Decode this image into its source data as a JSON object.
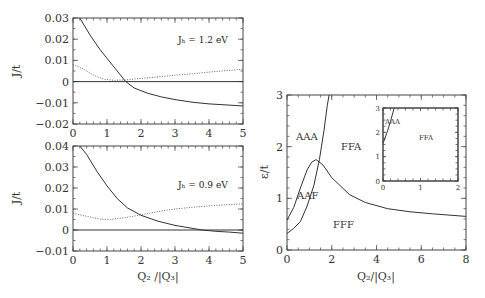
{
  "chart_data": [
    {
      "type": "line",
      "title": "",
      "annotation": "J_H = 1.2 eV",
      "xlabel": "",
      "ylabel": "J/t",
      "xlim": [
        0,
        5
      ],
      "ylim": [
        -0.02,
        0.03
      ],
      "xticks": [
        "0",
        "1",
        "2",
        "3",
        "4",
        "5"
      ],
      "yticks": [
        "-0.02",
        "-0.01",
        "0",
        "0.01",
        "0.02",
        "0.03"
      ],
      "grid": false,
      "series": [
        {
          "name": "solid",
          "style": "solid",
          "x": [
            0.2,
            0.5,
            0.8,
            1.0,
            1.3,
            1.55,
            1.8,
            2.2,
            2.6,
            3.0,
            3.5,
            4.0,
            4.5,
            5.0
          ],
          "y": [
            0.03,
            0.022,
            0.015,
            0.011,
            0.005,
            0.0,
            -0.003,
            -0.0055,
            -0.0072,
            -0.0085,
            -0.0097,
            -0.0105,
            -0.011,
            -0.0115
          ]
        },
        {
          "name": "dotted",
          "style": "dotted",
          "x": [
            0.0,
            0.3,
            0.6,
            0.9,
            1.2,
            1.55,
            2.0,
            2.5,
            3.0,
            3.5,
            4.0,
            4.5,
            5.0
          ],
          "y": [
            0.008,
            0.006,
            0.003,
            0.0012,
            0.0006,
            0.0008,
            0.0015,
            0.0022,
            0.003,
            0.0037,
            0.0045,
            0.0052,
            0.0058
          ]
        },
        {
          "name": "zero",
          "style": "solid",
          "x": [
            0,
            5
          ],
          "y": [
            0,
            0
          ]
        }
      ]
    },
    {
      "type": "line",
      "title": "",
      "annotation": "J_H = 0.9 eV",
      "xlabel": "Q2 /|Q3|",
      "ylabel": "J/t",
      "xlim": [
        0,
        5
      ],
      "ylim": [
        -0.01,
        0.04
      ],
      "xticks": [
        "0",
        "1",
        "2",
        "3",
        "4",
        "5"
      ],
      "yticks": [
        "-0.01",
        "0",
        "0.01",
        "0.02",
        "0.03",
        "0.04"
      ],
      "grid": false,
      "series": [
        {
          "name": "solid",
          "style": "solid",
          "x": [
            0.2,
            0.4,
            0.7,
            1.0,
            1.3,
            1.6,
            2.0,
            2.5,
            3.0,
            3.5,
            3.8,
            4.2,
            4.6,
            5.0
          ],
          "y": [
            0.04,
            0.036,
            0.028,
            0.021,
            0.015,
            0.0105,
            0.007,
            0.0042,
            0.0022,
            0.0008,
            0.0,
            -0.0006,
            -0.001,
            -0.0015
          ]
        },
        {
          "name": "dotted",
          "style": "dotted",
          "x": [
            0.0,
            0.4,
            0.8,
            1.1,
            1.5,
            2.0,
            2.5,
            3.0,
            3.5,
            4.0,
            4.5,
            5.0
          ],
          "y": [
            0.008,
            0.0065,
            0.0052,
            0.005,
            0.0058,
            0.0072,
            0.0088,
            0.01,
            0.0108,
            0.0115,
            0.012,
            0.0125
          ]
        },
        {
          "name": "zero",
          "style": "solid",
          "x": [
            0,
            5
          ],
          "y": [
            0,
            0
          ]
        }
      ]
    },
    {
      "type": "line",
      "title": "",
      "xlabel": "Q2/|Q3|",
      "ylabel": "ε/t",
      "xlim": [
        0,
        8
      ],
      "ylim": [
        0,
        3
      ],
      "xticks": [
        "0",
        "2",
        "4",
        "6",
        "8"
      ],
      "yticks": [
        "0",
        "1",
        "2",
        "3"
      ],
      "grid": false,
      "region_labels": [
        "AAA",
        "FFA",
        "AAF",
        "FFF"
      ],
      "series": [
        {
          "name": "boundary-AAA-FFA",
          "style": "solid",
          "x": [
            0.0,
            0.3,
            0.6,
            0.9,
            1.2,
            1.45,
            1.65,
            1.8,
            1.88
          ],
          "y": [
            0.32,
            0.42,
            0.55,
            0.85,
            1.25,
            1.75,
            2.3,
            2.8,
            3.0
          ]
        },
        {
          "name": "boundary-AAF-upper",
          "style": "solid",
          "x": [
            0.0,
            0.3,
            0.6,
            0.9,
            1.1,
            1.3
          ],
          "y": [
            0.58,
            0.82,
            1.2,
            1.55,
            1.7,
            1.75
          ]
        },
        {
          "name": "boundary-FFF",
          "style": "solid",
          "x": [
            1.3,
            1.6,
            2.0,
            2.8,
            3.5,
            4.5,
            5.5,
            6.5,
            8.0
          ],
          "y": [
            1.75,
            1.65,
            1.4,
            1.07,
            0.92,
            0.8,
            0.74,
            0.7,
            0.65
          ]
        }
      ],
      "inset": {
        "xlim": [
          0,
          2
        ],
        "ylim": [
          0,
          3
        ],
        "xticks": [
          "0",
          "1",
          "2"
        ],
        "yticks": [
          "0",
          "1",
          "2",
          "3"
        ],
        "region_labels": [
          "AAA",
          "FFA"
        ],
        "series": [
          {
            "name": "boundary",
            "style": "solid",
            "x": [
              0.0,
              0.05,
              0.12,
              0.2,
              0.26,
              0.3
            ],
            "y": [
              1.55,
              1.75,
              2.05,
              2.45,
              2.8,
              3.0
            ]
          }
        ]
      }
    }
  ]
}
